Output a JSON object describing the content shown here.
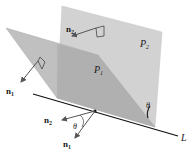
{
  "figure": {
    "planes": [
      {
        "id": "P1",
        "label": "P",
        "subscript": "1",
        "color": "#b8b8b8"
      },
      {
        "id": "P2",
        "label": "P",
        "subscript": "2",
        "color": "#cfcfcf"
      }
    ],
    "normals": [
      {
        "label": "n",
        "subscript": "1",
        "on_plane": "P1"
      },
      {
        "label": "n",
        "subscript": "2",
        "on_plane": "P2"
      }
    ],
    "line": {
      "label": "L"
    },
    "angle": {
      "label": "θ"
    },
    "origin_normals": [
      {
        "label": "n",
        "subscript": "2"
      },
      {
        "label": "n",
        "subscript": "1"
      }
    ],
    "colors": {
      "arrow": "#555555",
      "line": "#111111",
      "text": "#1a1a1a"
    }
  }
}
